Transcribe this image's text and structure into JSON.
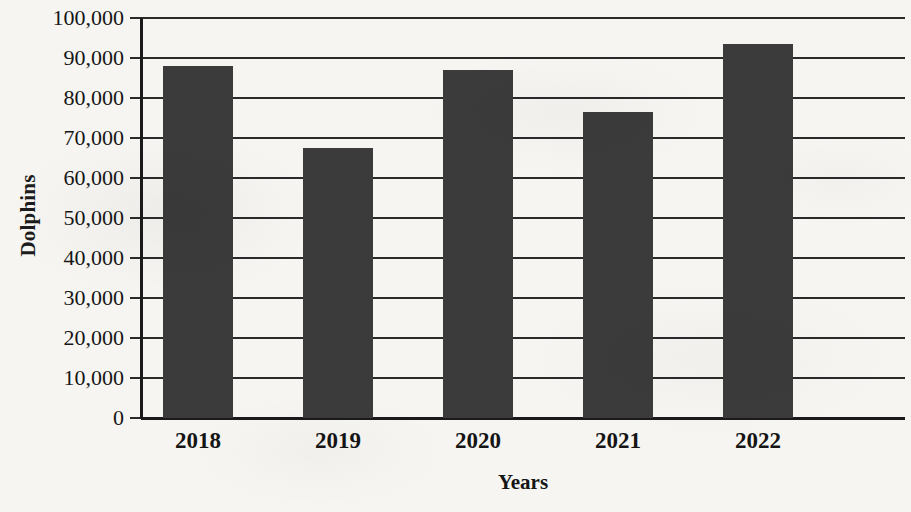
{
  "chart_data": {
    "type": "bar",
    "title": "",
    "xlabel": "Years",
    "ylabel": "Dolphins",
    "categories": [
      "2018",
      "2019",
      "2020",
      "2021",
      "2022"
    ],
    "values": [
      88000,
      67500,
      87000,
      76500,
      93500
    ],
    "ylim": [
      0,
      100000
    ],
    "y_ticks": [
      0,
      10000,
      20000,
      30000,
      40000,
      50000,
      60000,
      70000,
      80000,
      90000,
      100000
    ],
    "y_tick_labels": [
      "0",
      "10,000",
      "20,000",
      "30,000",
      "40,000",
      "50,000",
      "60,000",
      "70,000",
      "80,000",
      "90,000",
      "100,000"
    ],
    "grid": true,
    "legend": null,
    "bar_color": "#3b3b3b",
    "axis_color": "#1a1a1a",
    "background_color": "#f6f5f2"
  }
}
